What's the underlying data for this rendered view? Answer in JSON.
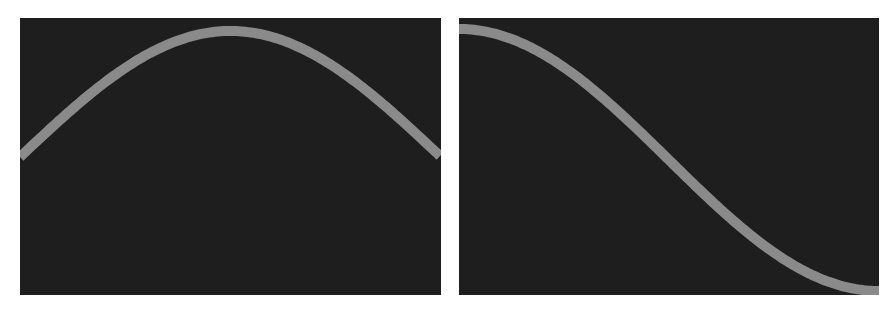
{
  "colors": {
    "background": "#ffffff",
    "panel": "#1e1e1e",
    "curve": "#8a8a8a"
  },
  "panels": [
    {
      "name": "left",
      "curve": "sine-arch",
      "description": "half-period sine, rising from mid-left to a top peak at center and falling back to mid-right"
    },
    {
      "name": "right",
      "curve": "cosine-descent",
      "description": "half-period cosine, starting at top-left and descending to bottom-right"
    }
  ]
}
